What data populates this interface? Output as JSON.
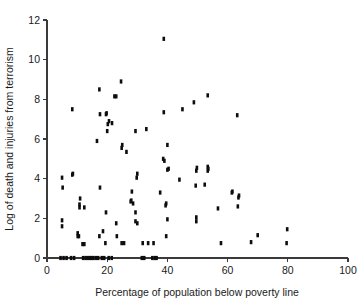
{
  "chart_data": {
    "type": "scatter",
    "title": "",
    "xlabel": "Percentage of population below poverty line",
    "ylabel": "Log of death and injuries from terrorism",
    "xlim": [
      0,
      100
    ],
    "ylim": [
      0,
      12
    ],
    "xticks": [
      0,
      20,
      40,
      60,
      80,
      100
    ],
    "yticks": [
      0,
      2,
      4,
      6,
      8,
      10,
      12
    ],
    "xtick_labels": [
      "0",
      "20",
      "40",
      "60",
      "80",
      "100"
    ],
    "ytick_labels": [
      "0",
      "2",
      "4",
      "6",
      "8",
      "10",
      "12"
    ],
    "grid": false,
    "legend": false,
    "marker_color": "#0d0d0d",
    "marker_shape": "square",
    "series": [
      {
        "name": "countries",
        "points": [
          [
            4.5,
            0.0
          ],
          [
            5.5,
            0.0
          ],
          [
            6.5,
            0.0
          ],
          [
            8.0,
            0.0
          ],
          [
            9.0,
            0.0
          ],
          [
            12.0,
            0.0
          ],
          [
            12.8,
            0.0
          ],
          [
            13.5,
            0.0
          ],
          [
            14.2,
            0.0
          ],
          [
            14.8,
            0.0
          ],
          [
            15.4,
            0.0
          ],
          [
            16.2,
            0.0
          ],
          [
            17.0,
            0.0
          ],
          [
            18.2,
            0.0
          ],
          [
            19.0,
            0.0
          ],
          [
            20.5,
            0.0
          ],
          [
            21.5,
            0.0
          ],
          [
            31.5,
            0.0
          ],
          [
            32.3,
            0.0
          ],
          [
            35.0,
            0.0
          ],
          [
            35.8,
            0.0
          ],
          [
            36.4,
            0.0
          ],
          [
            5.0,
            1.6
          ],
          [
            5.0,
            1.9
          ],
          [
            10.2,
            1.1
          ],
          [
            10.2,
            1.25
          ],
          [
            10.6,
            1.1
          ],
          [
            11.8,
            0.7
          ],
          [
            12.4,
            0.7
          ],
          [
            17.4,
            1.1
          ],
          [
            18.6,
            1.35
          ],
          [
            19.4,
            0.75
          ],
          [
            23.0,
            1.75
          ],
          [
            23.2,
            1.1
          ],
          [
            24.8,
            0.75
          ],
          [
            25.6,
            0.75
          ],
          [
            29.4,
            1.85
          ],
          [
            30.0,
            1.75
          ],
          [
            31.8,
            0.75
          ],
          [
            33.6,
            0.75
          ],
          [
            35.4,
            0.75
          ],
          [
            39.6,
            1.1
          ],
          [
            40.0,
            1.95
          ],
          [
            49.6,
            1.85
          ],
          [
            49.6,
            2.05
          ],
          [
            57.8,
            0.75
          ],
          [
            67.8,
            0.8
          ],
          [
            70.0,
            1.15
          ],
          [
            79.6,
            0.75
          ],
          [
            79.8,
            1.45
          ],
          [
            5.2,
            3.55
          ],
          [
            5.0,
            4.05
          ],
          [
            8.4,
            4.2
          ],
          [
            8.6,
            4.25
          ],
          [
            10.8,
            2.55
          ],
          [
            10.8,
            2.7
          ],
          [
            11.0,
            3.0
          ],
          [
            12.4,
            2.55
          ],
          [
            17.6,
            3.55
          ],
          [
            19.6,
            2.3
          ],
          [
            27.8,
            2.85
          ],
          [
            28.0,
            2.9
          ],
          [
            28.2,
            3.35
          ],
          [
            28.6,
            2.75
          ],
          [
            29.4,
            2.3
          ],
          [
            29.8,
            4.05
          ],
          [
            30.0,
            4.25
          ],
          [
            37.6,
            3.3
          ],
          [
            39.4,
            2.65
          ],
          [
            39.6,
            2.75
          ],
          [
            40.0,
            4.45
          ],
          [
            40.4,
            4.5
          ],
          [
            40.0,
            5.7
          ],
          [
            39.0,
            4.9
          ],
          [
            38.6,
            5.0
          ],
          [
            44.0,
            3.95
          ],
          [
            49.4,
            3.65
          ],
          [
            49.6,
            4.4
          ],
          [
            49.8,
            4.55
          ],
          [
            52.4,
            3.7
          ],
          [
            53.4,
            4.4
          ],
          [
            53.4,
            4.6
          ],
          [
            53.6,
            4.5
          ],
          [
            56.8,
            2.5
          ],
          [
            61.4,
            3.3
          ],
          [
            61.6,
            3.35
          ],
          [
            63.4,
            2.6
          ],
          [
            63.6,
            3.05
          ],
          [
            63.8,
            3.15
          ],
          [
            8.4,
            7.5
          ],
          [
            16.6,
            5.9
          ],
          [
            17.6,
            7.25
          ],
          [
            17.4,
            8.5
          ],
          [
            19.6,
            7.25
          ],
          [
            19.8,
            7.3
          ],
          [
            20.0,
            6.4
          ],
          [
            20.2,
            6.75
          ],
          [
            20.6,
            6.9
          ],
          [
            21.6,
            6.8
          ],
          [
            22.4,
            8.15
          ],
          [
            23.0,
            8.15
          ],
          [
            24.6,
            8.9
          ],
          [
            24.8,
            5.55
          ],
          [
            25.0,
            5.7
          ],
          [
            26.4,
            5.35
          ],
          [
            29.4,
            6.4
          ],
          [
            33.0,
            6.5
          ],
          [
            38.8,
            11.05
          ],
          [
            38.8,
            7.35
          ],
          [
            45.0,
            7.5
          ],
          [
            48.8,
            7.85
          ],
          [
            53.4,
            8.2
          ],
          [
            63.2,
            7.2
          ]
        ]
      }
    ]
  },
  "axes": {
    "x_title": "Percentage of population below poverty line",
    "y_title": "Log of death and injuries from terrorism"
  }
}
